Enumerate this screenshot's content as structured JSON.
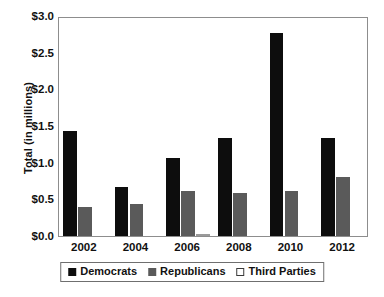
{
  "chart_data": {
    "type": "bar",
    "title": "",
    "xlabel": "",
    "ylabel": "Total (in millions)",
    "categories": [
      "2002",
      "2004",
      "2006",
      "2008",
      "2010",
      "2012"
    ],
    "series": [
      {
        "name": "Democrats",
        "color": "#0d0d0d",
        "values": [
          1.43,
          0.67,
          1.06,
          1.34,
          2.77,
          1.33
        ]
      },
      {
        "name": "Republicans",
        "color": "#5a5a5a",
        "values": [
          0.39,
          0.44,
          0.61,
          0.58,
          0.62,
          0.8
        ]
      },
      {
        "name": "Third Parties",
        "color": "#ffffff",
        "values": [
          0.0,
          0.0,
          0.03,
          0.0,
          0.0,
          0.0
        ]
      }
    ],
    "ylim": [
      0.0,
      3.0
    ],
    "ytick_values": [
      0.0,
      0.5,
      1.0,
      1.5,
      2.0,
      2.5,
      3.0
    ],
    "ytick_labels": [
      "$0.0",
      "$0.5",
      "$1.0",
      "$1.5",
      "$2.0",
      "$2.5",
      "$3.0"
    ],
    "grid": false,
    "legend_position": "bottom-center",
    "frame": true
  }
}
